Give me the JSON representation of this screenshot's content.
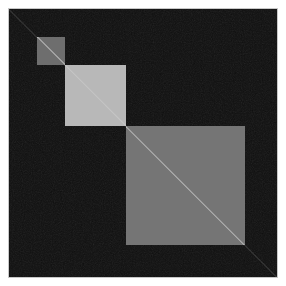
{
  "figure": {
    "title": "",
    "background_color": "#ffffff",
    "plot_background_color": "#0d0d0d",
    "border_color": "#c8c8c8",
    "width": 286,
    "height": 286
  },
  "chart_data": {
    "type": "heatmap",
    "title": "",
    "subtitle": "",
    "xlabel": "",
    "ylabel": "",
    "xlim": [
      0,
      270
    ],
    "ylim": [
      0,
      270
    ],
    "xticks": [],
    "yticks": [],
    "xticklabels": [],
    "yticklabels": [],
    "grid": false,
    "legend": false,
    "colorbar": false,
    "colormap": "gray",
    "background_value": 0.05,
    "background_color": "#0d0d0d",
    "diagonal_color": "#d0d0d0",
    "blocks": [
      {
        "index": 1,
        "label": "cluster-1",
        "start": 29,
        "end": 57,
        "size": 28,
        "value": 0.43,
        "color": "#6e6e6e"
      },
      {
        "index": 2,
        "label": "cluster-2",
        "start": 57,
        "end": 118,
        "size": 61,
        "value": 0.72,
        "color": "#b8b8b8"
      },
      {
        "index": 3,
        "label": "cluster-3",
        "start": 118,
        "end": 237,
        "size": 119,
        "value": 0.46,
        "color": "#757575"
      }
    ]
  }
}
